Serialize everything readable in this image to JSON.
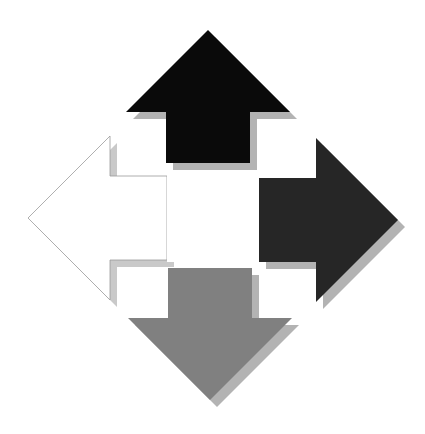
{
  "figure": {
    "name": "four-directional-arrows",
    "width": 425,
    "height": 434,
    "background_color": "#ffffff"
  },
  "style": {
    "shadow_color": "#b3b3b3",
    "shadow_color_light": "#c9c9c9",
    "shadow_offset_x": 7,
    "shadow_offset_y": 7,
    "hairline_color": "#9a9a9a",
    "hairline_width": 0.8
  },
  "arrows": [
    {
      "id": "arrow-up",
      "direction": "up",
      "label": "Up arrow",
      "fill_color": "#0a0a0a",
      "shadow_color": "#b3b3b3",
      "outlined": false,
      "tip": {
        "x": 208,
        "y": 30
      },
      "points": "208,30 290,112 250,112 250,163 166,163 166,112 126,112",
      "shadow_points": "215,37 297,119 257,119 257,170 173,170 173,119 133,119"
    },
    {
      "id": "arrow-right",
      "direction": "right",
      "label": "Right arrow",
      "fill_color": "#262626",
      "shadow_color": "#b3b3b3",
      "outlined": false,
      "tip": {
        "x": 398,
        "y": 220
      },
      "points": "398,220 316,302 316,262 259,262 259,178 316,178 316,138",
      "shadow_points": "405,227 323,309 323,269 266,269 266,185 323,185 323,145"
    },
    {
      "id": "arrow-down",
      "direction": "down",
      "label": "Down arrow",
      "fill_color": "#808080",
      "shadow_color": "#b3b3b3",
      "outlined": false,
      "tip": {
        "x": 210,
        "y": 400
      },
      "points": "210,400 128,318 168,318 168,268 252,268 252,318 292,318",
      "shadow_points": "217,407 135,325 175,325 175,275 259,275 259,325 299,325"
    },
    {
      "id": "arrow-left",
      "direction": "left",
      "label": "Left arrow",
      "fill_color": "#ffffff",
      "shadow_color": "#c9c9c9",
      "outlined": true,
      "outline_color": "#9a9a9a",
      "tip": {
        "x": 28,
        "y": 218
      },
      "points": "28,218 110,136 110,176 167,176 167,260 110,260 110,300",
      "shadow_points": "35,225 117,143 117,183 174,183 174,267 117,267 117,307"
    }
  ],
  "center": {
    "id": "center-gap",
    "label": "Hollow white center",
    "fill_color": "#ffffff",
    "x": 167,
    "y": 170,
    "width": 85,
    "height": 92
  },
  "chart_data": {
    "type": "diagram",
    "categories": [
      "up",
      "right",
      "down",
      "left"
    ],
    "values": [
      1,
      1,
      1,
      1
    ],
    "series": [
      {
        "name": "fill shade (0=black, 255=white)",
        "values": [
          10,
          38,
          128,
          255
        ]
      }
    ],
    "legend": [
      "Up: black",
      "Right: dark charcoal",
      "Down: medium gray",
      "Left: white outline"
    ]
  }
}
